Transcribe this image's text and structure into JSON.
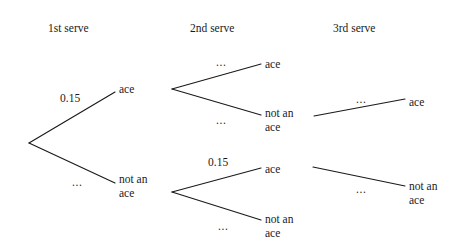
{
  "figure": {
    "kind": "probability-tree-diagram",
    "background_color": "#ffffff",
    "line_color": "#1a1a1a",
    "text_color": "#1a1a1a"
  },
  "headers": [
    {
      "label": "1st serve",
      "x": 48,
      "y": 22
    },
    {
      "label": "2nd serve",
      "x": 190,
      "y": 22
    },
    {
      "label": "3rd serve",
      "x": 333,
      "y": 22
    }
  ],
  "nodes": [
    {
      "name": "root",
      "label": "",
      "x": 29,
      "y": 143
    },
    {
      "name": "serve1-ace",
      "lines": [
        "ace"
      ],
      "x": 119,
      "y": 82
    },
    {
      "name": "serve1-not-ace",
      "lines": [
        "not an",
        "ace"
      ],
      "x": 119,
      "y": 172
    },
    {
      "name": "serve2-branch-upper",
      "label": "",
      "x": 172,
      "y": 89
    },
    {
      "name": "serve2-upper-ace",
      "lines": [
        "ace"
      ],
      "x": 265,
      "y": 57
    },
    {
      "name": "serve2-upper-not-ace",
      "lines": [
        "not an",
        "ace"
      ],
      "x": 265,
      "y": 106
    },
    {
      "name": "serve2-branch-lower",
      "label": "",
      "x": 172,
      "y": 192
    },
    {
      "name": "serve2-lower-ace",
      "lines": [
        "ace"
      ],
      "x": 265,
      "y": 162
    },
    {
      "name": "serve2-lower-not-ace",
      "lines": [
        "not an",
        "ace"
      ],
      "x": 265,
      "y": 212
    },
    {
      "name": "serve3-upper-ace",
      "lines": [
        "ace"
      ],
      "x": 409,
      "y": 95
    },
    {
      "name": "serve3-lower-not-ace",
      "lines": [
        "not an",
        "ace"
      ],
      "x": 409,
      "y": 179
    }
  ],
  "edges": [
    {
      "name": "root-to-serve1-ace",
      "x1": 29,
      "y1": 143,
      "x2": 115,
      "y2": 92
    },
    {
      "name": "root-to-serve1-not-ace",
      "x1": 29,
      "y1": 143,
      "x2": 115,
      "y2": 183
    },
    {
      "name": "serve1-ace-to-serve2-branch",
      "x1": 172,
      "y1": 89,
      "x2": 172,
      "y2": 89
    },
    {
      "name": "serve2-upper-to-ace",
      "x1": 172,
      "y1": 89,
      "x2": 261,
      "y2": 64
    },
    {
      "name": "serve2-upper-to-not-ace",
      "x1": 172,
      "y1": 89,
      "x2": 261,
      "y2": 115
    },
    {
      "name": "serve2-lower-to-ace",
      "x1": 172,
      "y1": 192,
      "x2": 261,
      "y2": 168
    },
    {
      "name": "serve2-lower-to-not-ace",
      "x1": 172,
      "y1": 192,
      "x2": 261,
      "y2": 220
    },
    {
      "name": "serve3-upper-edge",
      "x1": 314,
      "y1": 116,
      "x2": 405,
      "y2": 99
    },
    {
      "name": "serve3-lower-edge",
      "x1": 313,
      "y1": 167,
      "x2": 405,
      "y2": 186
    }
  ],
  "edge_labels": [
    {
      "name": "prob-first-serve-ace",
      "text": "0.15",
      "x": 60,
      "y": 92
    },
    {
      "name": "prob-first-serve-not-ace",
      "text": "...",
      "x": 72,
      "y": 176
    },
    {
      "name": "prob-second-serve-upper-ace",
      "text": "...",
      "x": 216,
      "y": 56
    },
    {
      "name": "prob-second-serve-upper-not-ace",
      "text": "...",
      "x": 216,
      "y": 114
    },
    {
      "name": "prob-second-serve-lower-ace",
      "text": "0.15",
      "x": 208,
      "y": 156
    },
    {
      "name": "prob-second-serve-lower-not-ace",
      "text": "...",
      "x": 218,
      "y": 220
    },
    {
      "name": "prob-third-serve-upper",
      "text": "...",
      "x": 356,
      "y": 93
    },
    {
      "name": "prob-third-serve-lower",
      "text": "...",
      "x": 356,
      "y": 183
    }
  ]
}
